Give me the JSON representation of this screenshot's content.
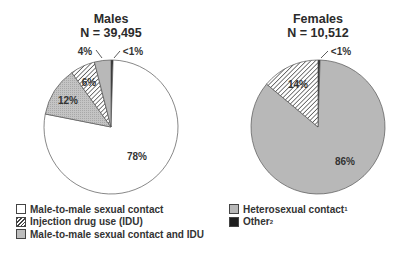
{
  "chart_data": [
    {
      "type": "pie",
      "title": "Males",
      "subtitle": "N = 39,495",
      "slices": [
        {
          "label": "Male-to-male sexual contact",
          "value": 78,
          "display": "78%"
        },
        {
          "label": "Heterosexual contact",
          "value": 4,
          "display": "4%"
        },
        {
          "label": "Injection drug use (IDU)",
          "value": 6,
          "display": "6%"
        },
        {
          "label": "Male-to-male sexual contact and IDU",
          "value": 12,
          "display": "12%"
        },
        {
          "label": "Other",
          "value": 0.5,
          "display": "<1%"
        }
      ]
    },
    {
      "type": "pie",
      "title": "Females",
      "subtitle": "N = 10,512",
      "slices": [
        {
          "label": "Heterosexual contact",
          "value": 86,
          "display": "86%"
        },
        {
          "label": "Injection drug use (IDU)",
          "value": 14,
          "display": "14%"
        },
        {
          "label": "Other",
          "value": 0.5,
          "display": "<1%"
        }
      ]
    }
  ],
  "males": {
    "title": "Males",
    "n": "N = 39,495"
  },
  "females": {
    "title": "Females",
    "n": "N = 10,512"
  },
  "legend": {
    "left": [
      {
        "label": "Male-to-male sexual contact",
        "pattern": "white"
      },
      {
        "label": "Injection drug use (IDU)",
        "pattern": "hatch"
      },
      {
        "label": "Male-to-male sexual contact and IDU",
        "pattern": "gray"
      }
    ],
    "right": [
      {
        "label": "Heterosexual contact",
        "sup": "1",
        "pattern": "gray"
      },
      {
        "label": "Other",
        "sup": "2",
        "pattern": "black"
      }
    ]
  },
  "colors": {
    "gray": "#b8b8b8",
    "black": "#1e1e1e",
    "white": "#ffffff",
    "hatch": "#444444"
  }
}
